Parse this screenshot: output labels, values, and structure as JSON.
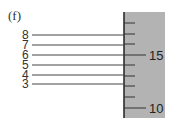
{
  "panel_label": "(f)",
  "lines": [
    {
      "label": "8",
      "y": 35
    },
    {
      "label": "7",
      "y": 45
    },
    {
      "label": "6",
      "y": 55
    },
    {
      "label": "5",
      "y": 65
    },
    {
      "label": "4",
      "y": 75
    },
    {
      "label": "3",
      "y": 84
    }
  ],
  "scale": {
    "background": "#b3b3b3",
    "labels": {
      "upper": "15",
      "lower": "10"
    },
    "ticks_y": [
      23,
      34,
      44,
      55,
      65,
      76,
      86,
      97,
      108
    ],
    "long_ticks_y": [
      55,
      108
    ]
  }
}
